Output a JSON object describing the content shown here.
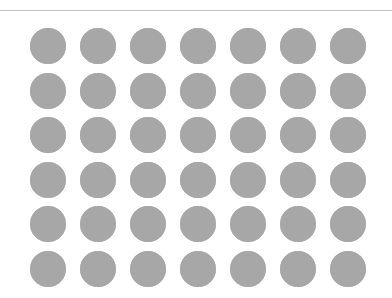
{
  "figure": {
    "rule": {
      "y": 10,
      "color": "#c4c4c4"
    },
    "grid": {
      "rows": 6,
      "cols": 7,
      "dot_color": "#a7a7a7",
      "dot_diameter": 36,
      "first_center_x": 47.5,
      "first_center_y": 46,
      "spacing_x": 50,
      "spacing_y": 44.6
    }
  }
}
